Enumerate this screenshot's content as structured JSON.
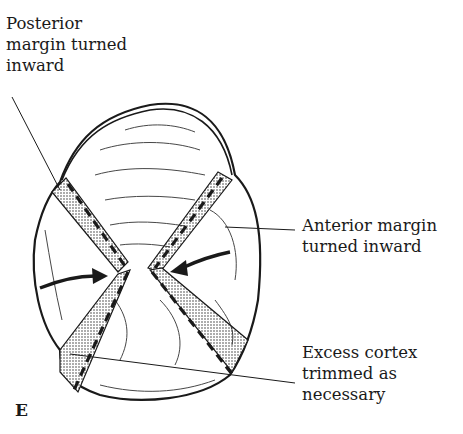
{
  "figure": {
    "panel_letter": "E",
    "labels": {
      "posterior": [
        "Posterior",
        "margin turned",
        "inward"
      ],
      "anterior": [
        "Anterior margin",
        "turned inward"
      ],
      "excess": [
        "Excess cortex",
        "trimmed as",
        "necessary"
      ]
    },
    "colors": {
      "ink": "#1a1a1a",
      "background": "#ffffff",
      "stipple": "#555555"
    }
  }
}
